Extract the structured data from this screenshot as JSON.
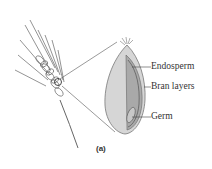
{
  "figure": {
    "caption": "(a)",
    "labels": {
      "endosperm": "Endosperm",
      "bran": "Bran layers",
      "germ": "Germ"
    },
    "colors": {
      "kernel_outer": "#d6d6d6",
      "kernel_cut": "#a9a9a9",
      "line": "#555555",
      "text": "#333333"
    }
  }
}
